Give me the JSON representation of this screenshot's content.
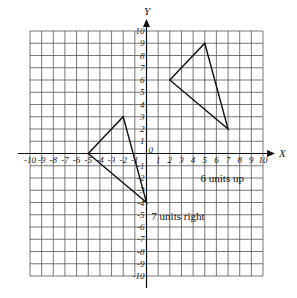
{
  "diagram": {
    "type": "coordinate-plane",
    "x_axis_label": "X",
    "y_axis_label": "Y",
    "x_range": [
      -10,
      10
    ],
    "y_range": [
      -10,
      10
    ],
    "origin_label": "0",
    "x_tick_labels": [
      "-10",
      "-9",
      "-8",
      "-7",
      "-6",
      "-5",
      "-4",
      "-3",
      "-2",
      "-1",
      "1",
      "2",
      "3",
      "4",
      "5",
      "6",
      "7",
      "8",
      "9",
      "10"
    ],
    "y_tick_labels": [
      "10",
      "9",
      "8",
      "7",
      "6",
      "5",
      "4",
      "3",
      "2",
      "1",
      "-1",
      "-2",
      "-3",
      "-4",
      "-5",
      "-6",
      "-7",
      "-8",
      "-9",
      "-10"
    ],
    "shapes": [
      {
        "name": "original-triangle",
        "vertices": [
          [
            -5,
            0
          ],
          [
            -2,
            3
          ],
          [
            0,
            -4
          ]
        ]
      },
      {
        "name": "translated-triangle",
        "vertices": [
          [
            2,
            6
          ],
          [
            5,
            9
          ],
          [
            7,
            2
          ]
        ]
      }
    ],
    "annotations": [
      {
        "text": "6 units up",
        "x": 6.5,
        "y": -2.3
      },
      {
        "text": "7 units right",
        "x": 2.7,
        "y": -5.4
      }
    ]
  },
  "colors": {
    "grid": "#555555",
    "axis": "#111111",
    "shape": "#111111",
    "background": "#ffffff"
  }
}
